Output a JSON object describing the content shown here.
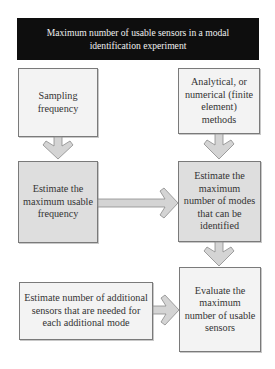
{
  "diagram": {
    "title": "Maximum number of usable sensors in a modal identification experiment",
    "nodes": [
      {
        "id": "sampling",
        "label": "Sampling frequency"
      },
      {
        "id": "analytical",
        "label": "Analytical, or numerical (finite element) methods"
      },
      {
        "id": "max_freq",
        "label": "Estimate the maximum usable frequency"
      },
      {
        "id": "max_modes",
        "label": "Estimate the maximum number of modes that can be identified"
      },
      {
        "id": "additional",
        "label": "Estimate number of additional sensors that are needed for each additional mode"
      },
      {
        "id": "evaluate",
        "label": "Evaluate the maximum number of usable sensors"
      }
    ],
    "edges": [
      {
        "from": "sampling",
        "to": "max_freq",
        "direction": "down"
      },
      {
        "from": "analytical",
        "to": "max_modes",
        "direction": "down"
      },
      {
        "from": "max_freq",
        "to": "max_modes",
        "direction": "right"
      },
      {
        "from": "max_modes",
        "to": "evaluate",
        "direction": "down"
      },
      {
        "from": "additional",
        "to": "evaluate",
        "direction": "right"
      }
    ],
    "colors": {
      "title_bg": "#0e0e0e",
      "title_text": "#f0f0f0",
      "box_light": "#f3f3f3",
      "box_dark": "#dedede",
      "border": "#7a7a7a",
      "arrow_fill": "#d4d4d4",
      "arrow_stroke": "#8a8a8a"
    }
  }
}
